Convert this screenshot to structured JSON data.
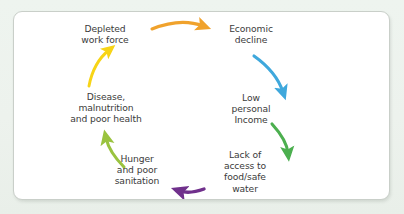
{
  "diagram": {
    "type": "cycle",
    "direction": "clockwise",
    "background_color": "#eef3ee",
    "card_color": "#ffffff",
    "card_border_color": "#c9cfc9",
    "text_color": "#3b3b3b",
    "nodes": [
      {
        "id": "depleted",
        "label": "Depleted\nwork force"
      },
      {
        "id": "economic",
        "label": "Economic\ndecline"
      },
      {
        "id": "lowincome",
        "label": "Low\npersonal\nIncome"
      },
      {
        "id": "lackof",
        "label": "Lack of\naccess to\nfood/safe\nwater"
      },
      {
        "id": "hunger",
        "label": "Hunger\nand poor\nsanitation"
      },
      {
        "id": "disease",
        "label": "Disease,\nmalnutrition\nand poor health"
      }
    ],
    "arrows": [
      {
        "id": "arrow-depleted-to-economic",
        "from": "depleted",
        "to": "economic",
        "color": "#f0a22c"
      },
      {
        "id": "arrow-economic-to-lowincome",
        "from": "economic",
        "to": "lowincome",
        "color": "#3fa8dc"
      },
      {
        "id": "arrow-lowincome-to-lackof",
        "from": "lowincome",
        "to": "lackof",
        "color": "#4caf4f"
      },
      {
        "id": "arrow-lackof-to-hunger",
        "from": "lackof",
        "to": "hunger",
        "color": "#70308c"
      },
      {
        "id": "arrow-hunger-to-disease",
        "from": "hunger",
        "to": "disease",
        "color": "#9ac33f"
      },
      {
        "id": "arrow-disease-to-depleted",
        "from": "disease",
        "to": "depleted",
        "color": "#f7d417"
      }
    ]
  }
}
